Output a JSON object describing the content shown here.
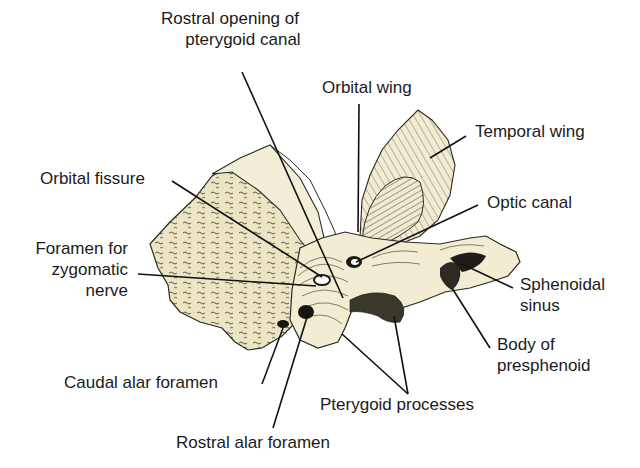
{
  "figure": {
    "colors": {
      "bone_fill": "#efe9cc",
      "bone_shade": "#d9d2a4",
      "bone_dark": "#8a8560",
      "outline": "#2a2a20",
      "leader_line": "#111111",
      "text": "#1b1b1b",
      "background": "#ffffff"
    }
  },
  "labels": {
    "rostral_opening_1": "Rostral opening of",
    "rostral_opening_2": "pterygoid canal",
    "orbital_wing": "Orbital wing",
    "temporal_wing": "Temporal wing",
    "orbital_fissure": "Orbital fissure",
    "optic_canal": "Optic canal",
    "foramen_zyg_1": "Foramen for",
    "foramen_zyg_2": "zygomatic",
    "foramen_zyg_3": "nerve",
    "sphenoidal_sinus_1": "Sphenoidal",
    "sphenoidal_sinus_2": "sinus",
    "body_presphenoid_1": "Body of",
    "body_presphenoid_2": "presphenoid",
    "caudal_alar": "Caudal alar foramen",
    "pterygoid_processes": "Pterygoid processes",
    "rostral_alar": "Rostral alar foramen"
  }
}
